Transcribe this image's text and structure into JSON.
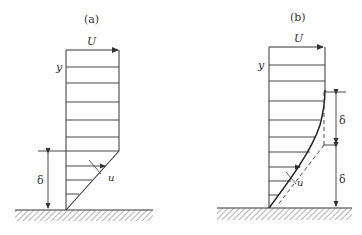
{
  "panels": [
    {
      "id": "a",
      "label": "(a)",
      "free_stream_label": "U",
      "y_label": "y",
      "velocity_label": "u",
      "thickness_label": "δ",
      "profile": "linear"
    },
    {
      "id": "b",
      "label": "(b)",
      "free_stream_label": "U",
      "y_label": "y",
      "velocity_label": "u",
      "thickness_label_upper": "δ",
      "thickness_label_lower": "δ",
      "profile": "curved"
    }
  ],
  "colors": {
    "ink": "#333333",
    "background": "#ffffff"
  }
}
